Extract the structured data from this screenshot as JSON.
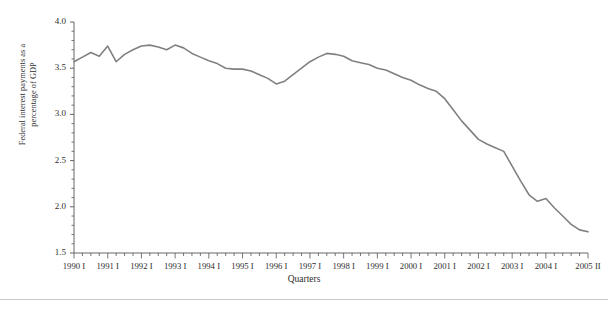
{
  "chart_data": {
    "type": "line",
    "title": "",
    "xlabel": "Quarters",
    "ylabel": "Federal interest payments as a\npercentage of GDP",
    "ylim": [
      1.5,
      4.0
    ],
    "ytick_labels": [
      "4.0",
      "3.5",
      "3.0",
      "2.5",
      "2.0",
      "1.5"
    ],
    "ytick_values": [
      4.0,
      3.5,
      3.0,
      2.5,
      2.0,
      1.5
    ],
    "yminor_step": 0.1,
    "grid": false,
    "legend": null,
    "legend_position": "none",
    "line_color": "#808080",
    "line_width": 1.6,
    "xtick_labels": [
      "1990 I",
      "1991 I",
      "1992 I",
      "1993 I",
      "1994 I",
      "1995 I",
      "1996 I",
      "1997 I",
      "1998 I",
      "1999 I",
      "2000 I",
      "2001 I",
      "2002 I",
      "2003 I",
      "2004 I",
      "2005 II"
    ],
    "xtick_indices": [
      0,
      4,
      8,
      12,
      16,
      20,
      24,
      28,
      32,
      36,
      40,
      44,
      48,
      52,
      56,
      61
    ],
    "x_quarters": [
      "1990 I",
      "1990 II",
      "1990 III",
      "1990 IV",
      "1991 I",
      "1991 II",
      "1991 III",
      "1991 IV",
      "1992 I",
      "1992 II",
      "1992 III",
      "1992 IV",
      "1993 I",
      "1993 II",
      "1993 III",
      "1993 IV",
      "1994 I",
      "1994 II",
      "1994 III",
      "1994 IV",
      "1995 I",
      "1995 II",
      "1995 III",
      "1995 IV",
      "1996 I",
      "1996 II",
      "1996 III",
      "1996 IV",
      "1997 I",
      "1997 II",
      "1997 III",
      "1997 IV",
      "1998 I",
      "1998 II",
      "1998 III",
      "1998 IV",
      "1999 I",
      "1999 II",
      "1999 III",
      "1999 IV",
      "2000 I",
      "2000 II",
      "2000 III",
      "2000 IV",
      "2001 I",
      "2001 II",
      "2001 III",
      "2001 IV",
      "2002 I",
      "2002 II",
      "2002 III",
      "2002 IV",
      "2003 I",
      "2003 II",
      "2003 III",
      "2003 IV",
      "2004 I",
      "2004 II",
      "2004 III",
      "2004 IV",
      "2005 I",
      "2005 II"
    ],
    "values": [
      3.57,
      3.62,
      3.67,
      3.63,
      3.74,
      3.57,
      3.65,
      3.7,
      3.74,
      3.75,
      3.73,
      3.7,
      3.75,
      3.72,
      3.66,
      3.62,
      3.58,
      3.55,
      3.5,
      3.49,
      3.49,
      3.47,
      3.43,
      3.39,
      3.33,
      3.36,
      3.43,
      3.5,
      3.57,
      3.62,
      3.66,
      3.65,
      3.63,
      3.58,
      3.56,
      3.54,
      3.5,
      3.48,
      3.44,
      3.4,
      3.37,
      3.32,
      3.28,
      3.25,
      3.17,
      3.05,
      2.93,
      2.83,
      2.73,
      2.68,
      2.64,
      2.6,
      2.44,
      2.28,
      2.13,
      2.06,
      2.09,
      1.99,
      1.9,
      1.81,
      1.75,
      1.73
    ]
  }
}
